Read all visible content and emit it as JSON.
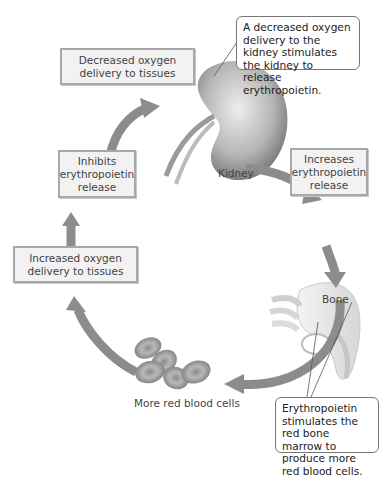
{
  "diagram": {
    "cycle_boxes": [
      {
        "id": "decreased",
        "text": "Decreased oxygen delivery to tissues"
      },
      {
        "id": "increases",
        "text": "Increases erythropoietin release"
      },
      {
        "id": "increased",
        "text": "Increased oxygen delivery to tissues"
      },
      {
        "id": "inhibits",
        "text": "Inhibits erythropoietin release"
      }
    ],
    "labels": {
      "kidney": "Kidney",
      "bone": "Bone",
      "rbc": "More red blood cells"
    },
    "callouts": {
      "kidney": "A decreased oxygen delivery to the kidney stimulates the kidney to release erythropoietin.",
      "bone": "Erythropoietin stimulates the red bone marrow to produce more red blood cells."
    },
    "colors": {
      "arrow": "#8c8c8c",
      "box_fill": "#f2f2f2",
      "box_border": "#a8a8a8",
      "rbc": "#9a9a9a"
    }
  }
}
